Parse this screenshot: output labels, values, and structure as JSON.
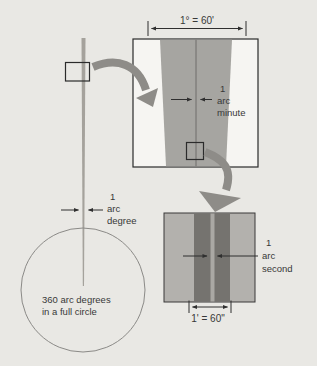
{
  "labels": {
    "degree_ruler": "1° = 60'",
    "arc_minute": [
      "1",
      "arc",
      "minute"
    ],
    "arc_degree": [
      "1",
      "arc",
      "degree"
    ],
    "arc_second": [
      "1",
      "arc",
      "second"
    ],
    "circle_caption": [
      "360 arc degrees",
      "in a full circle"
    ],
    "minute_ruler": "1' = 60\""
  },
  "colors": {
    "background": "#e9e8e4",
    "box_fill": "#f6f5f2",
    "box_border": "#2b2b2b",
    "wedge_gray": "#a6a5a1",
    "wedge_centerline": "#6e6d6a",
    "panel_gray": "#b3b1ad",
    "dark_band": "#75736f",
    "arcsecond_strip": "#aaa8a4",
    "big_arrow_gray": "#8e8c88",
    "reference_line": "#a5a29c",
    "circle_stroke": "#8b8a87",
    "dimension_stroke": "#2f2f2f",
    "text": "#383838"
  }
}
